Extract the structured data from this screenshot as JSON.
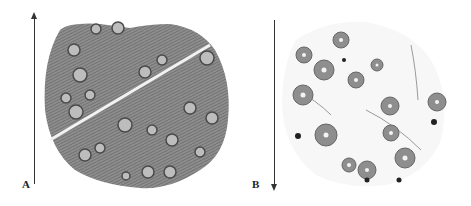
{
  "figure": {
    "panels": [
      {
        "label": "A",
        "arrow_direction": "up",
        "description": "Dense tissue cross-section with numerous follicles in dark-stained matrix"
      },
      {
        "label": "B",
        "arrow_direction": "down",
        "description": "Sparse tissue cross-section with scattered circular follicles in pale matrix"
      }
    ]
  },
  "colors": {
    "background": "#ffffff",
    "arrow": "#333333",
    "tissue_dark": "#6f6f6f",
    "tissue_light": "#d8d8d8",
    "follicle": "#8a8a8a"
  }
}
